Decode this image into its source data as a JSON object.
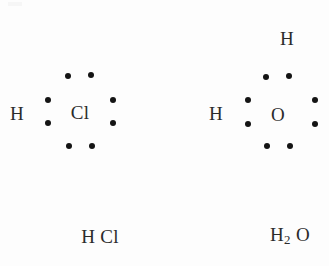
{
  "figure": {
    "kind": "lewis-dot-structure-diagram",
    "background_color": "#fdfdfd",
    "dot_color": "#141414",
    "text_color": "#2b2b2b",
    "width": 329,
    "height": 266
  },
  "molecules": [
    {
      "id": "hcl",
      "name": "hydrogen-chloride",
      "central_atom": {
        "symbol": "Cl",
        "x": 80,
        "y": 112
      },
      "bonded_atoms": [
        {
          "symbol": "H",
          "x": 17,
          "y": 113,
          "position": "left"
        }
      ],
      "electron_dots": [
        {
          "x": 68,
          "y": 76,
          "pair": "top",
          "role": "lone-pair"
        },
        {
          "x": 91,
          "y": 75,
          "pair": "top",
          "role": "lone-pair"
        },
        {
          "x": 48,
          "y": 100,
          "pair": "left",
          "role": "bonding-pair"
        },
        {
          "x": 48,
          "y": 123,
          "pair": "left",
          "role": "bonding-pair"
        },
        {
          "x": 113,
          "y": 100,
          "pair": "right",
          "role": "lone-pair"
        },
        {
          "x": 113,
          "y": 123,
          "pair": "right",
          "role": "lone-pair"
        },
        {
          "x": 69,
          "y": 146,
          "pair": "bottom",
          "role": "lone-pair"
        },
        {
          "x": 92,
          "y": 146,
          "pair": "bottom",
          "role": "lone-pair"
        }
      ],
      "dot_count": 8,
      "formula": {
        "text": "H Cl",
        "parts": [
          {
            "text": "H",
            "sub": false
          },
          {
            "text": " Cl",
            "sub": false
          }
        ],
        "x": 100,
        "y": 236
      }
    },
    {
      "id": "h2o",
      "name": "water",
      "central_atom": {
        "symbol": "O",
        "x": 278,
        "y": 114
      },
      "bonded_atoms": [
        {
          "symbol": "H",
          "x": 216,
          "y": 113,
          "position": "left"
        },
        {
          "symbol": "H",
          "x": 287,
          "y": 38,
          "position": "top"
        }
      ],
      "electron_dots": [
        {
          "x": 266,
          "y": 77,
          "pair": "top",
          "role": "bonding-pair"
        },
        {
          "x": 289,
          "y": 76,
          "pair": "top",
          "role": "bonding-pair"
        },
        {
          "x": 248,
          "y": 100,
          "pair": "left",
          "role": "bonding-pair"
        },
        {
          "x": 248,
          "y": 124,
          "pair": "left",
          "role": "bonding-pair"
        },
        {
          "x": 315,
          "y": 100,
          "pair": "right",
          "role": "lone-pair"
        },
        {
          "x": 315,
          "y": 124,
          "pair": "right",
          "role": "lone-pair"
        },
        {
          "x": 267,
          "y": 146,
          "pair": "bottom",
          "role": "lone-pair"
        },
        {
          "x": 290,
          "y": 146,
          "pair": "bottom",
          "role": "lone-pair"
        }
      ],
      "dot_count": 8,
      "formula": {
        "text": "H2 O",
        "parts": [
          {
            "text": "H",
            "sub": false
          },
          {
            "text": "2",
            "sub": true
          },
          {
            "text": " O",
            "sub": false
          }
        ],
        "x": 290,
        "y": 236
      }
    }
  ]
}
